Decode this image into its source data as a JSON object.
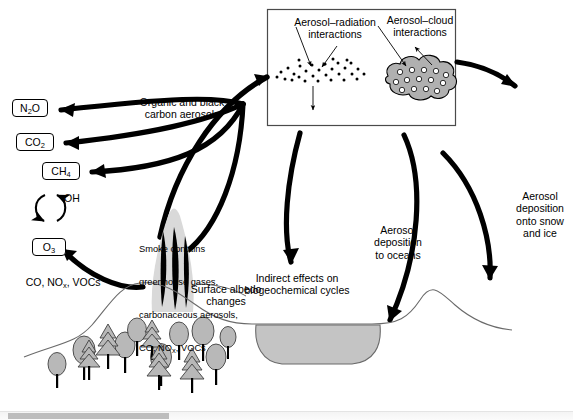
{
  "figure": {
    "background_color": "#ffffff",
    "ink_color": "#000000",
    "fill_gray": "#b8b8b8",
    "smoke_gray": "#d9d9d9",
    "water_gray": "#c4c4c4"
  },
  "inset_panel": {
    "name": "aerosol-interactions-panel",
    "border_color": "#4a4a4a",
    "radiation_label": "Aerosol–radiation\ninteractions",
    "cloud_label": "Aerosol–cloud\ninteractions"
  },
  "labels": {
    "organic_black_carbon": "Organic and black\ncarbon aerosols",
    "smoke_contents_line1": "Smoke contains",
    "smoke_contents_line2": "greenhouse gases,",
    "smoke_contents_line3": "carbonaceous aerosols,",
    "smoke_contents_line4_a": "CO, NO",
    "smoke_contents_line4_sub": "x",
    "smoke_contents_line4_b": ", VOCs",
    "surface_albedo": "Surface albedo\nchanges",
    "indirect_effects": "Indirect effects on\nbiogeochemical cycles",
    "aerosol_deposition_oceans": "Aerosol\ndeposition\nto oceans",
    "aerosol_deposition_snow": "Aerosol\ndeposition\nonto snow\nand ice",
    "precursors_a": "CO, NO",
    "precursors_sub": "x",
    "precursors_b": ", VOCs",
    "oh_radical": "OH"
  },
  "species_boxes": [
    {
      "id": "n2o",
      "formula": "N2O",
      "base": "N",
      "sub": "2",
      "tail": "O"
    },
    {
      "id": "co2",
      "formula": "CO2",
      "base": "CO",
      "sub": "2",
      "tail": ""
    },
    {
      "id": "ch4",
      "formula": "CH4",
      "base": "CH",
      "sub": "4",
      "tail": ""
    },
    {
      "id": "o3",
      "formula": "O3",
      "base": "O",
      "sub": "3",
      "tail": ""
    }
  ],
  "scrollbar": {
    "name": "horizontal-scrollbar",
    "thumb_color": "#bdbdbd",
    "track_color": "#f4f4f4"
  }
}
